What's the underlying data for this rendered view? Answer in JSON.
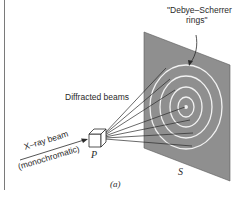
{
  "figure": {
    "panel_label": "(a)",
    "labels": {
      "rings_line1": "\"Debye–Scherrer",
      "rings_line2": "rings\"",
      "diffracted": "Diffracted beams",
      "xray_line1": "X–ray beam",
      "xray_line2": "(monochromatic)",
      "sample": "P",
      "screen": "S"
    },
    "colors": {
      "plate": "#8f8f8f",
      "plate_edge": "#5a5a5a",
      "rings": "#f2f2f2",
      "lines": "#2a2a2a",
      "border": "#7a7a7a"
    }
  }
}
